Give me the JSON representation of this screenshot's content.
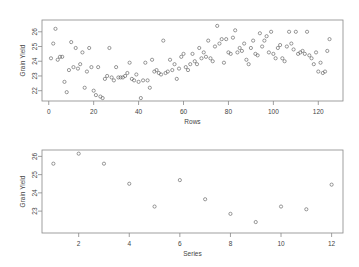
{
  "chart_data": [
    {
      "type": "scatter",
      "title": "",
      "xlabel": "Rows",
      "ylabel": "Grain Yield",
      "xlim": [
        -3,
        131
      ],
      "ylim": [
        21.3,
        26.8
      ],
      "xticks": [
        0,
        20,
        40,
        60,
        80,
        100,
        120
      ],
      "yticks": [
        22,
        23,
        24,
        25,
        26
      ],
      "grid": false,
      "legend": null,
      "marker": "open-circle",
      "x": [
        1,
        2,
        3,
        4,
        5,
        6,
        7,
        8,
        9,
        10,
        11,
        12,
        13,
        14,
        15,
        16,
        17,
        18,
        19,
        20,
        21,
        22,
        23,
        24,
        25,
        26,
        27,
        28,
        29,
        30,
        31,
        32,
        33,
        34,
        35,
        36,
        37,
        38,
        39,
        40,
        41,
        42,
        43,
        44,
        45,
        46,
        47,
        48,
        49,
        50,
        51,
        52,
        53,
        54,
        55,
        56,
        57,
        58,
        59,
        60,
        61,
        62,
        63,
        64,
        65,
        66,
        67,
        68,
        69,
        70,
        71,
        72,
        73,
        74,
        75,
        76,
        77,
        78,
        79,
        80,
        81,
        82,
        83,
        84,
        85,
        86,
        87,
        88,
        89,
        90,
        91,
        92,
        93,
        94,
        95,
        96,
        97,
        98,
        99,
        100,
        101,
        102,
        103,
        104,
        105,
        106,
        107,
        108,
        109,
        110,
        111,
        112,
        113,
        114,
        115,
        116,
        117,
        118,
        119,
        120,
        121,
        122,
        123,
        124,
        125
      ],
      "y": [
        24.2,
        25.2,
        26.2,
        24.1,
        24.3,
        24.3,
        22.6,
        21.9,
        23.4,
        25.3,
        23.6,
        24.9,
        23.5,
        23.8,
        24.6,
        22.2,
        23.3,
        24.9,
        23.6,
        22.0,
        21.7,
        23.6,
        21.6,
        21.5,
        22.8,
        23.0,
        24.9,
        22.9,
        22.7,
        23.6,
        22.9,
        22.9,
        22.9,
        23.0,
        23.2,
        23.9,
        22.8,
        22.7,
        23.1,
        22.6,
        21.5,
        22.7,
        23.9,
        22.7,
        22.2,
        24.1,
        23.3,
        23.4,
        23.2,
        23.1,
        25.4,
        23.2,
        23.3,
        24.1,
        23.4,
        23.8,
        22.8,
        23.5,
        24.3,
        24.5,
        23.6,
        23.4,
        23.8,
        24.5,
        24.0,
        23.8,
        24.9,
        24.2,
        24.6,
        24.3,
        25.4,
        24.2,
        24.0,
        25.0,
        26.4,
        25.2,
        25.5,
        23.9,
        25.5,
        24.6,
        24.5,
        25.6,
        26.1,
        24.6,
        24.9,
        24.7,
        25.2,
        24.1,
        23.8,
        24.9,
        25.4,
        24.5,
        24.4,
        25.9,
        25.0,
        25.4,
        25.7,
        24.6,
        26.0,
        24.5,
        24.2,
        24.9,
        25.1,
        24.2,
        24.0,
        25.0,
        26.0,
        25.2,
        24.8,
        26.0,
        24.5,
        24.6,
        24.7,
        24.5,
        26.0,
        24.4,
        24.2,
        23.8,
        24.6,
        23.3,
        23.9,
        23.2,
        23.3,
        24.7,
        25.5
      ]
    },
    {
      "type": "scatter",
      "title": "",
      "xlabel": "Series",
      "ylabel": "Grain Yield",
      "xlim": [
        0.55,
        12.45
      ],
      "ylim": [
        21.8,
        26.35
      ],
      "xticks": [
        2,
        4,
        6,
        8,
        10,
        12
      ],
      "yticks": [
        23,
        24,
        25,
        26
      ],
      "grid": false,
      "legend": null,
      "marker": "open-circle",
      "x": [
        1,
        2,
        3,
        4,
        5,
        6,
        7,
        8,
        9,
        10,
        11,
        12
      ],
      "y": [
        25.6,
        26.15,
        25.6,
        24.5,
        23.25,
        24.7,
        23.65,
        22.85,
        22.4,
        23.25,
        23.1,
        24.45
      ]
    }
  ]
}
